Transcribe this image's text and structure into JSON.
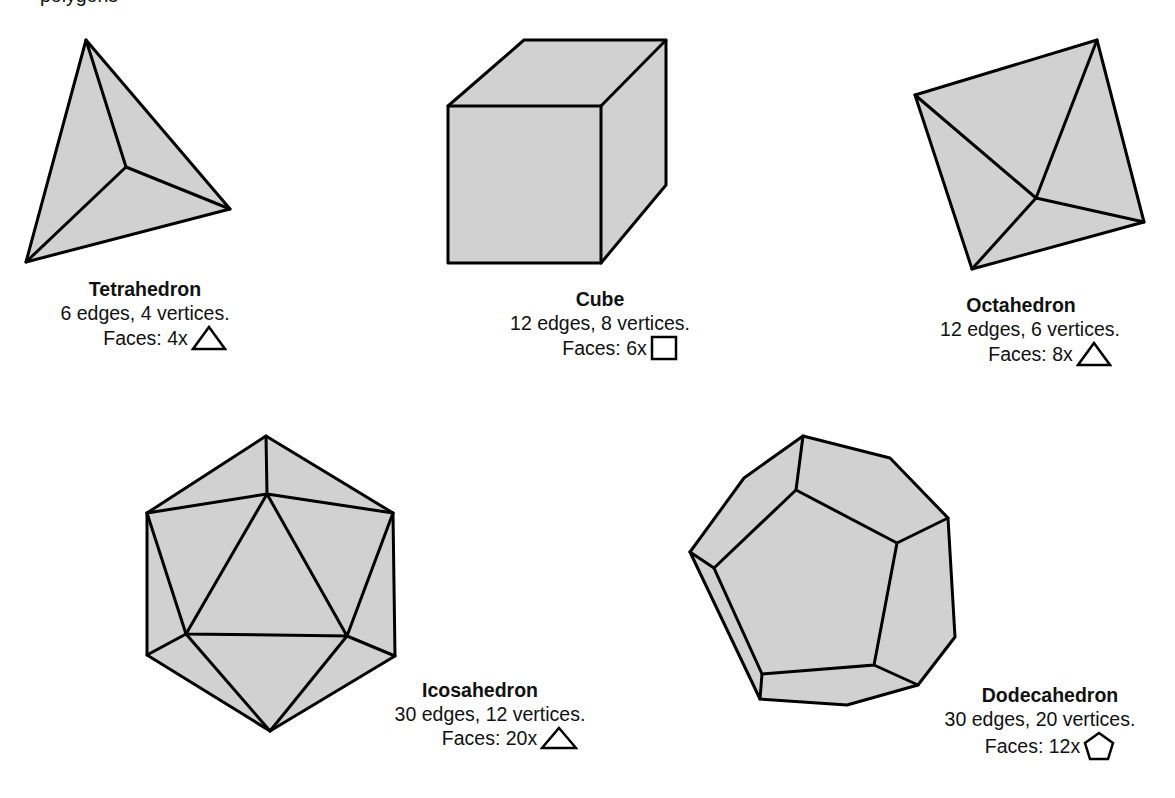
{
  "header": {
    "partial_text": "polygons"
  },
  "polyhedra": [
    {
      "name": "Tetrahedron",
      "stats": "6 edges, 4 vertices.",
      "faces_label": "Faces: 4x",
      "face_icon": "triangle-icon"
    },
    {
      "name": "Cube",
      "stats": "12 edges, 8 vertices.",
      "faces_label": "Faces: 6x",
      "face_icon": "square-icon"
    },
    {
      "name": "Octahedron",
      "stats": "12 edges, 6 vertices.",
      "faces_label": "Faces: 8x",
      "face_icon": "triangle-icon"
    },
    {
      "name": "Icosahedron",
      "stats": "30 edges, 12 vertices.",
      "faces_label": "Faces: 20x",
      "face_icon": "triangle-icon"
    },
    {
      "name": "Dodecahedron",
      "stats": "30 edges, 20 vertices.",
      "faces_label": "Faces: 12x",
      "face_icon": "pentagon-icon"
    }
  ],
  "colors": {
    "fill": "#d1d1d1",
    "stroke": "#000000"
  }
}
